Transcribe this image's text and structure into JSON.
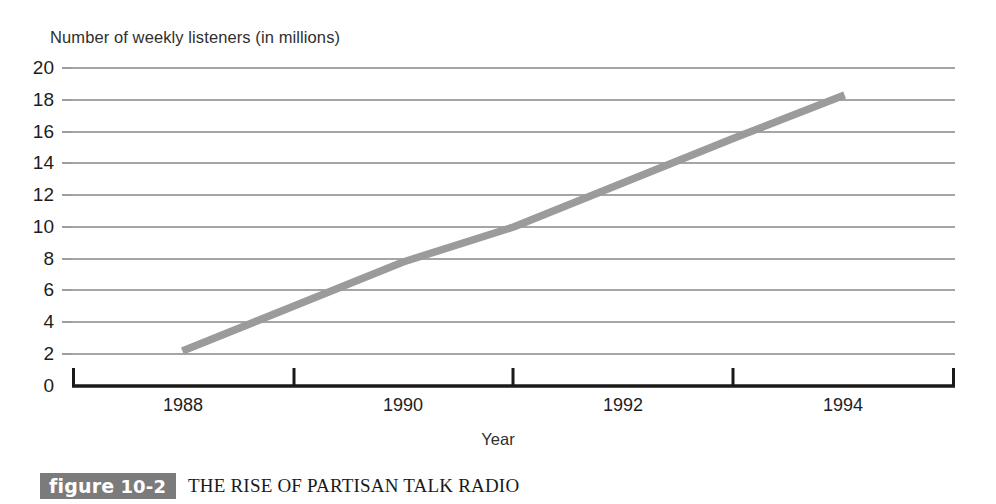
{
  "chart_data": {
    "type": "line",
    "title": "",
    "xlabel": "Year",
    "ylabel": "Number of weekly listeners (in millions)",
    "x": [
      1988,
      1989,
      1990,
      1991,
      1992,
      1993,
      1994
    ],
    "values": [
      2.2,
      5.0,
      7.8,
      10.0,
      12.8,
      15.6,
      18.3
    ],
    "series": [
      {
        "name": "Weekly talk radio listeners",
        "values": [
          2.2,
          5.0,
          7.8,
          10.0,
          12.8,
          15.6,
          18.3
        ]
      }
    ],
    "xlim": [
      1987,
      1995
    ],
    "ylim": [
      0,
      20
    ],
    "ytick_labels": [
      "20",
      "18",
      "16",
      "14",
      "12",
      "10",
      "8",
      "6",
      "4",
      "2",
      "0"
    ],
    "ytick_values": [
      20,
      18,
      16,
      14,
      12,
      10,
      8,
      6,
      4,
      2,
      0
    ],
    "xtick_labels": [
      "1988",
      "1990",
      "1992",
      "1994"
    ],
    "xtick_values": [
      1988,
      1990,
      1992,
      1994
    ],
    "grid": "horizontal",
    "legend": "none",
    "line_color": "#9b9b9b",
    "grid_color": "#4d4d4d",
    "axis_color": "#1a1a1a"
  },
  "caption": {
    "badge_word": "figure",
    "badge_number": "10-2",
    "badge_color": "#7b7b7b",
    "title": "THE RISE OF PARTISAN TALK RADIO"
  }
}
